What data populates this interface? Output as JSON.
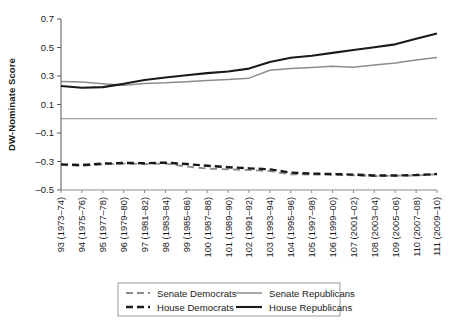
{
  "chart_data": {
    "type": "line",
    "title": "",
    "xlabel": "",
    "ylabel": "DW-Nominate Score",
    "ylim": [
      -0.5,
      0.7
    ],
    "yticks": [
      0.7,
      0.5,
      0.3,
      0.1,
      -0.1,
      -0.3,
      -0.5
    ],
    "ytick_labels": [
      "0.7",
      "0.5",
      "0.3",
      "0.1",
      "–0.1",
      "–0.3",
      "–0.5"
    ],
    "grid": false,
    "zero_line": true,
    "legend_position": "bottom",
    "categories": [
      "93 (1973–74)",
      "94 (1975–76)",
      "95 (1977–78)",
      "96 (1979–80)",
      "97 (1981–82)",
      "98 (1983–84)",
      "99 (1985–86)",
      "100 (1987–88)",
      "101 (1989–90)",
      "102 (1991–92)",
      "103 (1993–94)",
      "104 (1995–96)",
      "105 (1997–98)",
      "106 (1999–00)",
      "107 (2001–02)",
      "108 (2003–04)",
      "109 (2005–06)",
      "110 (2007–08)",
      "111 (2009–10)"
    ],
    "series": [
      {
        "name": "Senate Democrats",
        "color": "#8c8c8c",
        "style": "dashed",
        "width": 1.8,
        "values": [
          -0.325,
          -0.33,
          -0.32,
          -0.315,
          -0.318,
          -0.315,
          -0.335,
          -0.35,
          -0.355,
          -0.36,
          -0.368,
          -0.39,
          -0.392,
          -0.393,
          -0.397,
          -0.402,
          -0.4,
          -0.398,
          -0.39
        ]
      },
      {
        "name": "Senate Republicans",
        "color": "#8c8c8c",
        "style": "solid",
        "width": 1.5,
        "values": [
          0.262,
          0.258,
          0.245,
          0.235,
          0.248,
          0.252,
          0.26,
          0.268,
          0.275,
          0.285,
          0.34,
          0.352,
          0.36,
          0.368,
          0.362,
          0.378,
          0.392,
          0.412,
          0.43
        ]
      },
      {
        "name": "House Democrats",
        "color": "#1a1a1a",
        "style": "dashed",
        "width": 2.4,
        "values": [
          -0.32,
          -0.325,
          -0.315,
          -0.31,
          -0.312,
          -0.308,
          -0.318,
          -0.33,
          -0.34,
          -0.348,
          -0.355,
          -0.378,
          -0.385,
          -0.388,
          -0.392,
          -0.398,
          -0.398,
          -0.395,
          -0.388
        ]
      },
      {
        "name": "House Republicans",
        "color": "#1a1a1a",
        "style": "solid",
        "width": 2.1,
        "values": [
          0.23,
          0.218,
          0.222,
          0.245,
          0.272,
          0.29,
          0.305,
          0.32,
          0.332,
          0.352,
          0.398,
          0.428,
          0.442,
          0.462,
          0.482,
          0.502,
          0.522,
          0.562,
          0.598
        ]
      }
    ]
  },
  "legend": {
    "items": [
      {
        "label": "Senate Democrats",
        "color": "#8c8c8c",
        "style": "dashed"
      },
      {
        "label": "Senate Republicans",
        "color": "#8c8c8c",
        "style": "solid"
      },
      {
        "label": "House Democrats",
        "color": "#1a1a1a",
        "style": "dashed"
      },
      {
        "label": "House Republicans",
        "color": "#1a1a1a",
        "style": "solid"
      }
    ]
  }
}
